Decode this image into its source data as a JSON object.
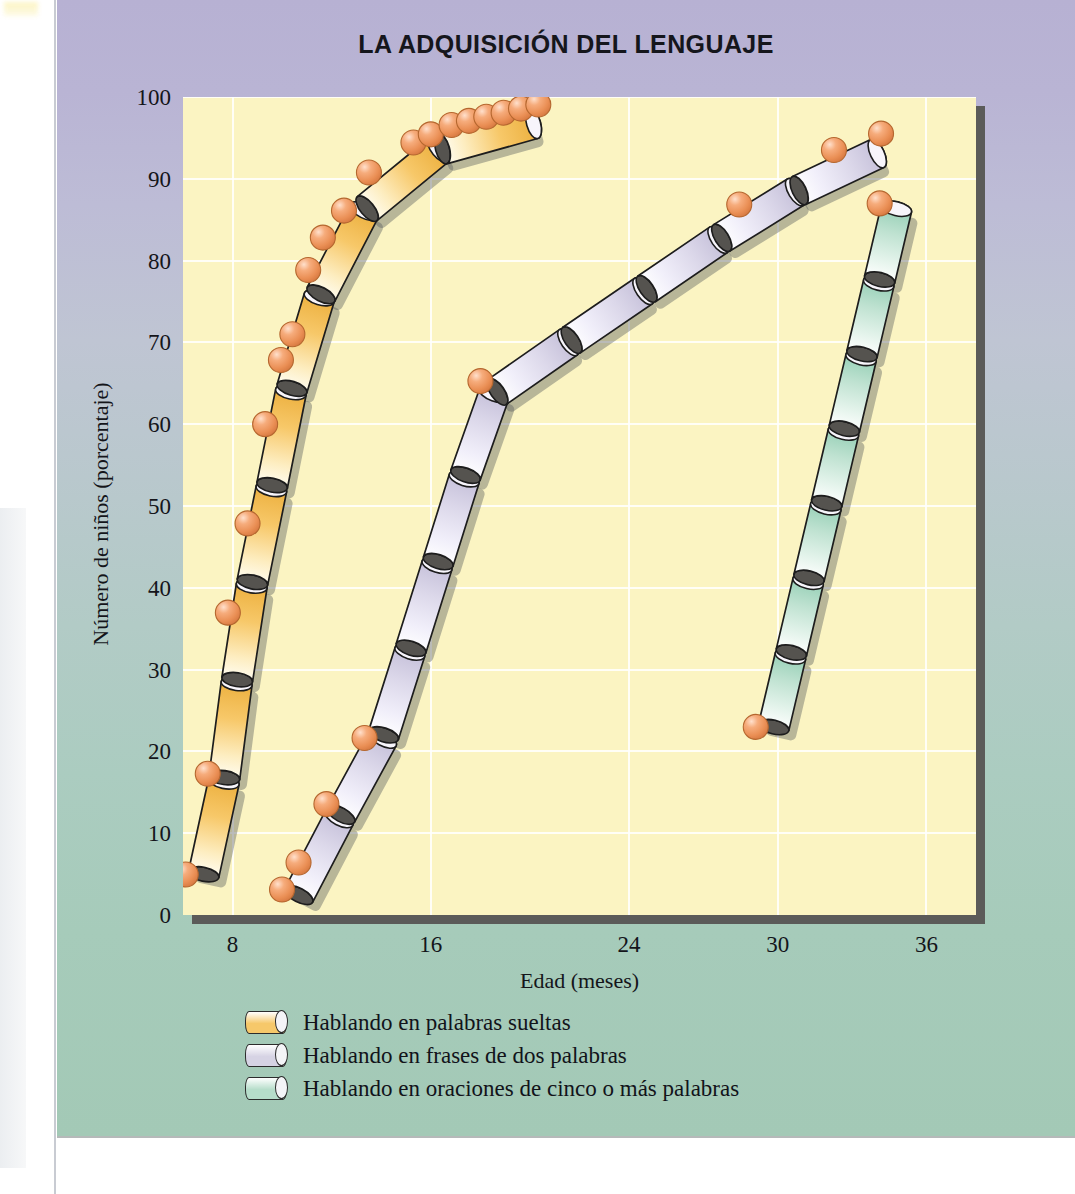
{
  "figure": {
    "title": "LA ADQUISICIÓN DEL LENGUAJE",
    "background_top": "#b7b1d3",
    "background_bottom": "#a3c9b6",
    "plot_background": "#fbf4c2"
  },
  "axes": {
    "y_title": "Número de niños (porcentaje)",
    "x_title": "Edad (meses)",
    "y_ticks": [
      "100",
      "90",
      "80",
      "70",
      "60",
      "50",
      "40",
      "30",
      "20",
      "10",
      "0"
    ],
    "x_ticks": [
      "8",
      "16",
      "24",
      "30",
      "36"
    ]
  },
  "legend": {
    "items": [
      {
        "label": "Hablando en palabras sueltas",
        "color": "#f6c86a"
      },
      {
        "label": "Hablando en frases de dos palabras",
        "color": "#d6d3e4"
      },
      {
        "label": "Hablando en oraciones de cinco o más palabras",
        "color": "#b6ddca"
      }
    ]
  },
  "chart_data": {
    "type": "line",
    "title": "LA ADQUISICIÓN DEL LENGUAJE",
    "xlabel": "Edad (meses)",
    "ylabel": "Número de niños (porcentaje)",
    "xlim": [
      6,
      38
    ],
    "ylim": [
      0,
      100
    ],
    "x_ticks": [
      8,
      16,
      24,
      30,
      36
    ],
    "y_ticks": [
      0,
      10,
      20,
      30,
      40,
      50,
      60,
      70,
      80,
      90,
      100
    ],
    "grid": true,
    "legend_position": "below-axes",
    "marker_color": "#ef9a63",
    "series": [
      {
        "name": "Hablando en palabras sueltas",
        "color": "#f6c86a",
        "points": [
          {
            "x": 6.8,
            "y": 4.5
          },
          {
            "x": 7.7,
            "y": 17.0
          },
          {
            "x": 8.5,
            "y": 36.5
          },
          {
            "x": 9.3,
            "y": 47.5
          },
          {
            "x": 10.0,
            "y": 59.5
          },
          {
            "x": 10.6,
            "y": 67.0
          },
          {
            "x": 11.1,
            "y": 70.5
          },
          {
            "x": 11.7,
            "y": 78.0
          },
          {
            "x": 12.2,
            "y": 81.5
          },
          {
            "x": 13.1,
            "y": 85.0
          },
          {
            "x": 13.9,
            "y": 89.0
          },
          {
            "x": 15.6,
            "y": 92.5
          },
          {
            "x": 16.3,
            "y": 93.5
          },
          {
            "x": 17.0,
            "y": 94.5
          },
          {
            "x": 17.7,
            "y": 95.0
          },
          {
            "x": 18.4,
            "y": 95.5
          },
          {
            "x": 19.1,
            "y": 96.0
          },
          {
            "x": 19.8,
            "y": 96.5
          },
          {
            "x": 20.5,
            "y": 97.0
          }
        ]
      },
      {
        "name": "Hablando en frases de dos palabras",
        "color": "#d6d3e4",
        "points": [
          {
            "x": 10.6,
            "y": 2.0
          },
          {
            "x": 11.3,
            "y": 5.5
          },
          {
            "x": 12.4,
            "y": 12.5
          },
          {
            "x": 14.0,
            "y": 21.0
          },
          {
            "x": 18.4,
            "y": 63.5
          },
          {
            "x": 28.8,
            "y": 85.0
          },
          {
            "x": 32.5,
            "y": 91.5
          },
          {
            "x": 34.4,
            "y": 93.5
          }
        ]
      },
      {
        "name": "Hablando en oraciones de cinco o más palabras",
        "color": "#b6ddca",
        "points": [
          {
            "x": 29.8,
            "y": 22.5
          },
          {
            "x": 34.8,
            "y": 86.5
          }
        ]
      }
    ]
  }
}
